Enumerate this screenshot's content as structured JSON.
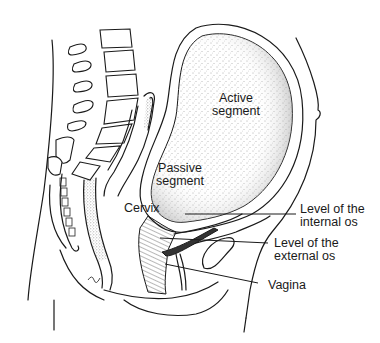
{
  "figure": {
    "labels": {
      "active_segment": "Active\nsegment",
      "passive_segment": "Passive\nsegment",
      "cervix": "Cervix",
      "internal_os": "Level of the\ninternal os",
      "external_os": "Level of the\nexternal os",
      "vagina": "Vagina"
    }
  },
  "colors": {
    "ink": "#1a1a1a",
    "background": "#ffffff",
    "stipple": "#555555"
  }
}
